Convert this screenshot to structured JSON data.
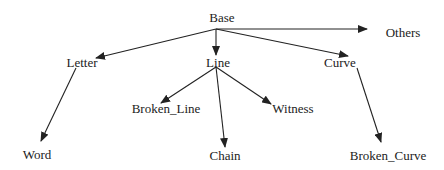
{
  "nodes": {
    "base": {
      "label": "Base",
      "x": 222,
      "y": 17
    },
    "others": {
      "label": "Others",
      "x": 404,
      "y": 32
    },
    "letter": {
      "label": "Letter",
      "x": 83,
      "y": 62
    },
    "line": {
      "label": "Line",
      "x": 219,
      "y": 62
    },
    "curve": {
      "label": "Curve",
      "x": 341,
      "y": 62
    },
    "broken_line": {
      "label": "Broken_Line",
      "x": 166,
      "y": 108
    },
    "witness": {
      "label": "Witness",
      "x": 293,
      "y": 108
    },
    "word": {
      "label": "Word",
      "x": 37,
      "y": 154
    },
    "chain": {
      "label": "Chain",
      "x": 225,
      "y": 155
    },
    "broken_curve": {
      "label": "Broken_Curve",
      "x": 388,
      "y": 155
    }
  },
  "edges": [
    {
      "from": "Base",
      "to": "Letter"
    },
    {
      "from": "Base",
      "to": "Line"
    },
    {
      "from": "Base",
      "to": "Curve"
    },
    {
      "from": "Base",
      "to": "Others"
    },
    {
      "from": "Letter",
      "to": "Word"
    },
    {
      "from": "Line",
      "to": "Broken_Line"
    },
    {
      "from": "Line",
      "to": "Chain"
    },
    {
      "from": "Line",
      "to": "Witness"
    },
    {
      "from": "Curve",
      "to": "Broken_Curve"
    }
  ],
  "colors": {
    "edge": "#222222",
    "text": "#222222",
    "background": "#ffffff"
  }
}
